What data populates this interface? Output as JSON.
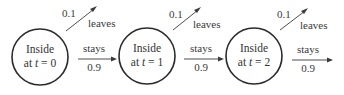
{
  "diagram": {
    "nodes": [
      {
        "line1": "Inside",
        "line2_prefix": "at ",
        "var": "t",
        "line2_suffix": " = 0"
      },
      {
        "line1": "Inside",
        "line2_prefix": "at ",
        "var": "t",
        "line2_suffix": " = 1"
      },
      {
        "line1": "Inside",
        "line2_prefix": "at ",
        "var": "t",
        "line2_suffix": " = 2"
      }
    ],
    "transitions": [
      {
        "leave_prob": "0.1",
        "leave_label": "leaves",
        "stay_label": "stays",
        "stay_prob": "0.9"
      },
      {
        "leave_prob": "0.1",
        "leave_label": "leaves",
        "stay_label": "stays",
        "stay_prob": "0.9"
      },
      {
        "leave_prob": "0.1",
        "leave_label": "leaves",
        "stay_label": "stays",
        "stay_prob": "0.9"
      }
    ],
    "colors": {
      "stroke": "#2b2b2b",
      "text": "#333333",
      "background": "#ffffff"
    }
  }
}
